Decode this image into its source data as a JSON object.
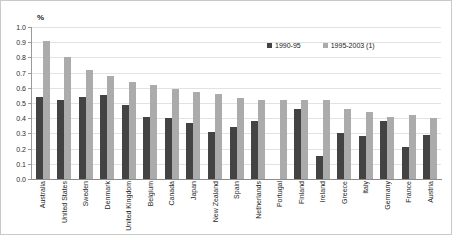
{
  "chart_data": {
    "type": "bar",
    "title": "",
    "subtitle": "",
    "xlabel": "",
    "ylabel": "%",
    "ylim": [
      0,
      1.0
    ],
    "ytick_labels": [
      "1.0",
      "0.9",
      "0.8",
      "0.7",
      "0.6",
      "0.5",
      "0.4",
      "0.3",
      "0.2",
      "0.1",
      "0.0"
    ],
    "ytick_values": [
      1.0,
      0.9,
      0.8,
      0.7,
      0.6,
      0.5,
      0.4,
      0.3,
      0.2,
      0.1,
      0.0
    ],
    "grid": true,
    "legend_position": "top-right",
    "categories": [
      "Australia",
      "United States",
      "Sweden",
      "Denmark",
      "United Kingdom",
      "Belgium",
      "Canada",
      "Japan",
      "New Zealand",
      "Spain",
      "Netherlands",
      "Portugal",
      "Finland",
      "Ireland",
      "Greece",
      "Italy",
      "Germany",
      "France",
      "Austria"
    ],
    "series": [
      {
        "name": "1990-95",
        "color": "#434343",
        "values": [
          0.54,
          0.52,
          0.54,
          0.55,
          0.49,
          0.41,
          0.4,
          0.37,
          0.31,
          0.34,
          0.38,
          0.0,
          0.46,
          0.15,
          0.3,
          0.28,
          0.38,
          0.21,
          0.29
        ]
      },
      {
        "name": "1995-2003 (1)",
        "color": "#ababab",
        "values": [
          0.91,
          0.8,
          0.72,
          0.68,
          0.64,
          0.62,
          0.59,
          0.57,
          0.56,
          0.53,
          0.52,
          0.52,
          0.52,
          0.52,
          0.46,
          0.44,
          0.41,
          0.42,
          0.4
        ]
      }
    ],
    "annotations": []
  },
  "legend": {
    "entries": [
      {
        "label": "1990-95"
      },
      {
        "label": "1995-2003 (1)"
      }
    ]
  }
}
